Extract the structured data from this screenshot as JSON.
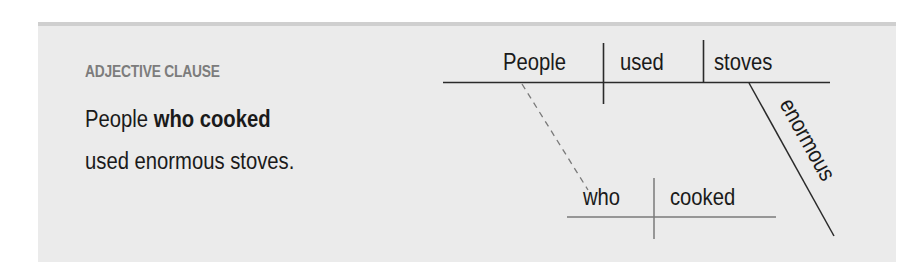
{
  "panel": {
    "label": "ADJECTIVE CLAUSE",
    "sentence": {
      "part1": "People ",
      "part2_bold": "who cooked",
      "line2": "used enormous stoves."
    }
  },
  "diagram": {
    "main_clause": {
      "subject": "People",
      "verb": "used",
      "object": "stoves",
      "modifier": "enormous"
    },
    "relative_clause": {
      "subject": "who",
      "verb": "cooked"
    }
  },
  "colors": {
    "panel_bg": "#ebebeb",
    "panel_top_border": "#cfcfcf",
    "label": "#7c7c7c",
    "text": "#1a1a1a",
    "main_lines": "#2a2a2a",
    "sub_lines": "#7a7a7a"
  }
}
